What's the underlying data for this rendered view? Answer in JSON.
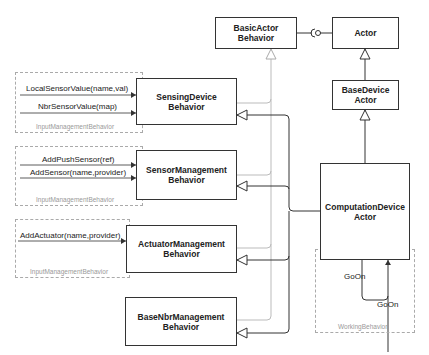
{
  "diagram": {
    "type": "UML class diagram",
    "classes": {
      "basic_actor_behavior": {
        "line1": "BasicActor",
        "line2": "Behavior"
      },
      "actor": {
        "line1": "Actor"
      },
      "base_device_actor": {
        "line1": "BaseDevice",
        "line2": "Actor"
      },
      "sensing_device_behavior": {
        "line1": "SensingDevice",
        "line2": "Behavior"
      },
      "sensor_management_behavior": {
        "line1": "SensorManagement",
        "line2": "Behavior"
      },
      "actuator_management_behavior": {
        "line1": "ActuatorManagement",
        "line2": "Behavior"
      },
      "base_nbr_management_behavior": {
        "line1": "BaseNbrManagement",
        "line2": "Behavior"
      },
      "computation_device_actor": {
        "line1": "ComputationDevice",
        "line2": "Actor"
      }
    },
    "input_groups": [
      {
        "label": "InputManagementBehavior",
        "messages": [
          "LocalSensorValue(name,val)",
          "NbrSensorValue(map)"
        ]
      },
      {
        "label": "InputManagementBehavior",
        "messages": [
          "AddPushSensor(ref)",
          "AddSensor(name,provider)"
        ]
      },
      {
        "label": "InputManagementBehavior",
        "messages": [
          "AddActuator(name,provider)"
        ]
      }
    ],
    "working_behavior": {
      "label": "WorkingBehavior",
      "messages": [
        "GoOn",
        "GoOn"
      ]
    },
    "colors": {
      "line": "#333333",
      "light_line": "#bbbbbb",
      "dashed_border": "#aaaaaa"
    }
  }
}
